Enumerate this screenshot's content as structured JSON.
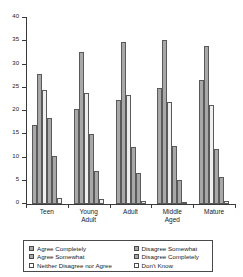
{
  "chart_data": {
    "type": "bar",
    "title": "",
    "xlabel": "",
    "ylabel": "",
    "ylim": [
      0,
      40
    ],
    "yticks": [
      0,
      5,
      10,
      15,
      20,
      25,
      30,
      35,
      40
    ],
    "grid": false,
    "legend_position": "bottom",
    "categories": [
      "Teen",
      "Young\nAdult",
      "Adult",
      "Middle\nAged",
      "Mature"
    ],
    "series": [
      {
        "name": "Agree Completely",
        "color": "#a8a8a8",
        "values": [
          17.0,
          20.5,
          22.3,
          24.9,
          26.7
        ]
      },
      {
        "name": "Agree Somewhat",
        "color": "#a8a8a8",
        "values": [
          28.0,
          32.6,
          34.9,
          35.3,
          33.9
        ]
      },
      {
        "name": "Neither Disagree nor Agree",
        "color": "#efefef",
        "values": [
          24.5,
          23.8,
          23.4,
          22.0,
          21.2
        ]
      },
      {
        "name": "Disagree Somewhat",
        "color": "#a8a8a8",
        "values": [
          18.4,
          15.0,
          12.3,
          12.4,
          11.9
        ]
      },
      {
        "name": "Disagree Completely",
        "color": "#a8a8a8",
        "values": [
          10.3,
          7.1,
          6.7,
          5.1,
          5.9
        ]
      },
      {
        "name": "Don't Know",
        "color": "#efefef",
        "values": [
          1.4,
          1.1,
          0.7,
          0.5,
          0.7
        ]
      }
    ]
  },
  "legend": {
    "items": [
      {
        "label": "Agree Completely",
        "swatch": "dark"
      },
      {
        "label": "Agree Somewhat",
        "swatch": "dark"
      },
      {
        "label": "Neither Disagree nor Agree",
        "swatch": "light"
      },
      {
        "label": "Disagree Somewhat",
        "swatch": "dark"
      },
      {
        "label": "Disagree Completely",
        "swatch": "dark"
      },
      {
        "label": "Don't Know",
        "swatch": "light"
      }
    ]
  }
}
